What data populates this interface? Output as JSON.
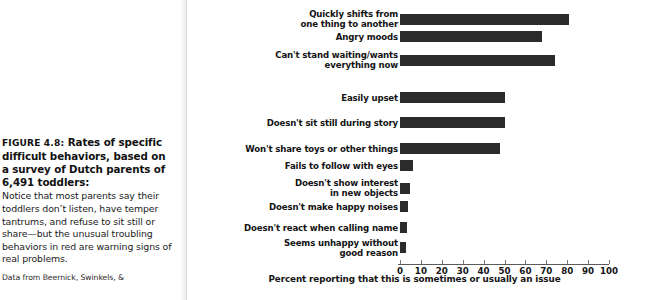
{
  "caption": {
    "figure_number": "FIGURE 4.8:",
    "title": "Rates of specific difficult behaviors, based on a survey of Dutch parents of 6,491 toddlers:",
    "body": "Notice that most parents say their toddlers don’t listen, have temper tantrums, and refuse to sit still or share—but the unusual troubling behaviors in red are warning signs of real problems.",
    "source": "Data from Beernick, Swinkels, &"
  },
  "chart_data": {
    "type": "bar",
    "orientation": "horizontal",
    "title": "",
    "xlabel": "Percent reporting that this is sometimes or usually an issue",
    "ylabel": "",
    "xlim": [
      0,
      100
    ],
    "xticks": [
      0,
      10,
      20,
      30,
      40,
      50,
      60,
      70,
      80,
      90,
      100
    ],
    "xtick_labels": [
      "0",
      "10",
      "20",
      "30",
      "40",
      "50",
      "60",
      "70",
      "80",
      "90",
      "100"
    ],
    "grid": false,
    "legend": "none",
    "bar_color": "#2b2b2b",
    "categories": [
      "Quickly shifts from\none thing to another",
      "Angry moods",
      "Can't stand waiting/wants\neverything now",
      "Easily upset",
      "Doesn't sit still during story",
      "Won't share toys or other things",
      "Fails to follow with eyes",
      "Doesn't show interest\nin new objects",
      "Doesn't make happy noises",
      "Doesn't react when calling name",
      "Seems unhappy without\ngood reason"
    ],
    "values": [
      81,
      68,
      74,
      50,
      50,
      48,
      6,
      5,
      4,
      3.5,
      3
    ]
  }
}
